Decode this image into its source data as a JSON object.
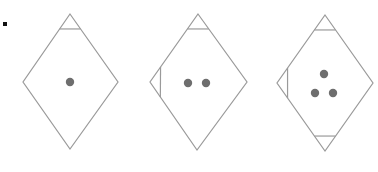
{
  "figure": {
    "colors": {
      "stroke": "#9a9a9a",
      "dot": "#6e6e6e",
      "bullet": "#111111"
    },
    "panels": [
      {
        "id": "panel-1",
        "diamond": {
          "top": [
            70,
            14
          ],
          "left": [
            23,
            82
          ],
          "right": [
            118,
            82
          ],
          "bottom": [
            70,
            149
          ]
        },
        "corner_triangles": [
          "top"
        ],
        "dots": [
          [
            70,
            82
          ]
        ]
      },
      {
        "id": "panel-2",
        "diamond": {
          "top": [
            198,
            14
          ],
          "left": [
            150,
            82
          ],
          "right": [
            247,
            82
          ],
          "bottom": [
            197,
            150
          ]
        },
        "corner_triangles": [
          "top",
          "left"
        ],
        "dots": [
          [
            188,
            83
          ],
          [
            206,
            83
          ]
        ]
      },
      {
        "id": "panel-3",
        "diamond": {
          "top": [
            325,
            15
          ],
          "left": [
            277,
            83
          ],
          "right": [
            373,
            83
          ],
          "bottom": [
            325,
            151
          ]
        },
        "corner_triangles": [
          "top",
          "left",
          "bottom"
        ],
        "dots": [
          [
            324,
            74
          ],
          [
            315,
            93
          ],
          [
            333,
            93
          ]
        ]
      }
    ]
  }
}
